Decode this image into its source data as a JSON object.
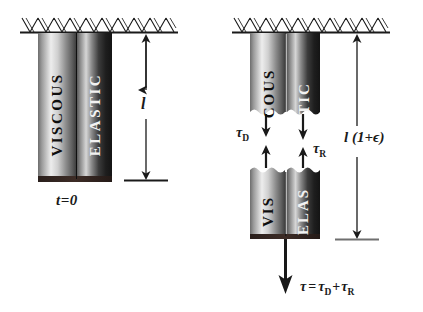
{
  "figure": {
    "type": "mechanical-model-diagram",
    "background_color": "#ffffff",
    "ink_color": "#1a1a1a"
  },
  "panels": [
    {
      "id": "initial-state",
      "caption": "t=0",
      "support": {
        "name": "fixed-ground-hatching",
        "hatch_style": "zigzag"
      },
      "cylinders": [
        {
          "id": "left-cylinder-initial",
          "label": "VISCOUS",
          "shade": "light",
          "light_hex": "#e8e8e8",
          "dark_hex": "#4a4a4a"
        },
        {
          "id": "right-cylinder-initial",
          "label": "ELASTIC",
          "shade": "dark",
          "light_hex": "#d2d2d2",
          "dark_hex": "#1c1c1c"
        }
      ],
      "dimension": {
        "id": "length-initial",
        "label": "l",
        "style": "double-arrow"
      }
    },
    {
      "id": "extended-state",
      "support": {
        "name": "fixed-ground-hatching",
        "hatch_style": "zigzag"
      },
      "upper_cylinders": [
        {
          "id": "upper-left-cylinder",
          "label": "COUS",
          "full_label": "VISCOUS",
          "shade": "light",
          "light_hex": "#e8e8e8",
          "dark_hex": "#4a4a4a"
        },
        {
          "id": "upper-right-cylinder",
          "label": "TIC",
          "full_label": "ELASTIC",
          "shade": "dark",
          "light_hex": "#d2d2d2",
          "dark_hex": "#1c1c1c"
        }
      ],
      "lower_cylinders": [
        {
          "id": "lower-left-cylinder",
          "label": "VIS",
          "full_label": "VISCOUS",
          "shade": "light",
          "light_hex": "#e8e8e8",
          "dark_hex": "#4a4a4a"
        },
        {
          "id": "lower-right-cylinder",
          "label": "ELAS",
          "full_label": "ELASTIC",
          "shade": "dark",
          "light_hex": "#d2d2d2",
          "dark_hex": "#1c1c1c"
        }
      ],
      "internal_forces": [
        {
          "id": "damping-stress",
          "label_base": "τ",
          "label_sub": "D",
          "side": "left"
        },
        {
          "id": "restoring-stress",
          "label_base": "τ",
          "label_sub": "R",
          "side": "right"
        }
      ],
      "dimension": {
        "id": "length-extended",
        "label": "l (1+ϵ)",
        "style": "double-arrow"
      },
      "applied_force": {
        "id": "total-stress",
        "equation": "τ = τD + τR",
        "tau": "τ",
        "equals": "=",
        "tau_d_base": "τ",
        "tau_d_sub": "D",
        "plus": "+",
        "tau_r_base": "τ",
        "tau_r_sub": "R",
        "direction": "down"
      }
    }
  ]
}
